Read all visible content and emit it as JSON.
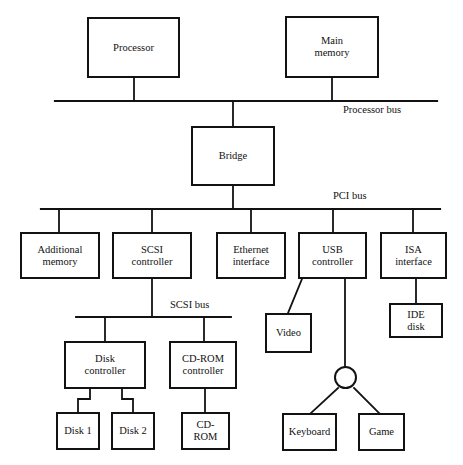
{
  "diagram": {
    "stroke_color": "#121212",
    "background_color": "#ffffff",
    "bus_labels": {
      "processor_bus": "Processor bus",
      "pci_bus": "PCI bus",
      "scsi_bus": "SCSI bus"
    },
    "nodes": {
      "processor": "Processor",
      "main_memory": "Main\nmemory",
      "bridge": "Bridge",
      "additional_memory": "Additional\nmemory",
      "scsi_controller": "SCSI\ncontroller",
      "ethernet_interface": "Ethernet\ninterface",
      "usb_controller": "USB\ncontroller",
      "isa_interface": "ISA\ninterface",
      "video": "Video",
      "ide_disk": "IDE\ndisk",
      "disk_controller": "Disk\ncontroller",
      "cdrom_controller": "CD-ROM\ncontroller",
      "disk_1": "Disk 1",
      "disk_2": "Disk 2",
      "cdrom": "CD-\nROM",
      "keyboard": "Keyboard",
      "game": "Game"
    }
  }
}
